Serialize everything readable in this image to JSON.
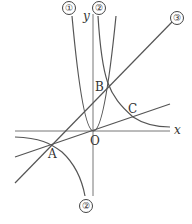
{
  "diagram": {
    "axes": {
      "x_label": "x",
      "y_label": "y",
      "origin_label": "O"
    },
    "points": {
      "A": "A",
      "B": "B",
      "C": "C"
    },
    "graph_labels": {
      "parabola": "①",
      "hyperbola_top": "②",
      "hyperbola_bottom": "②",
      "line": "③"
    },
    "stroke_color": "#555555"
  }
}
